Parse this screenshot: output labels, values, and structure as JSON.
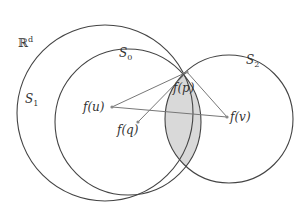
{
  "labels": {
    "space": "ℝ",
    "space_sup": "d",
    "s0": "S",
    "s0_sub": "0",
    "s1": "S",
    "s1_sub": "1",
    "s2": "S",
    "s2_sub": "2",
    "fp": "f(p)",
    "fu": "f(u)",
    "fq": "f(q)",
    "fv": "f(v)"
  },
  "colors": {
    "circle": "#444444",
    "segment": "#777777",
    "shade": "#d9d9d9"
  },
  "segments": [
    [
      "fu",
      "fp"
    ],
    [
      "fq",
      "fp"
    ],
    [
      "fv",
      "fp"
    ],
    [
      "fu",
      "fv"
    ]
  ]
}
